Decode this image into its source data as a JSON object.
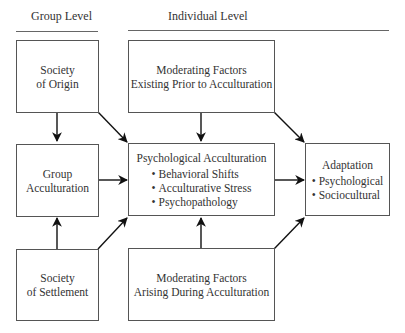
{
  "headers": {
    "group_level": "Group Level",
    "individual_level": "Individual Level"
  },
  "boxes": {
    "society_origin": {
      "line1": "Society",
      "line2": "of Origin"
    },
    "group_acculturation": {
      "line1": "Group",
      "line2": "Acculturation"
    },
    "society_settlement": {
      "line1": "Society",
      "line2": "of Settlement"
    },
    "moderating_prior": {
      "line1": "Moderating Factors",
      "line2": "Existing Prior to Acculturation"
    },
    "psychological_acculturation": {
      "title": "Psychological Acculturation",
      "items": [
        "Behavioral Shifts",
        "Acculturative Stress",
        "Psychopathology"
      ]
    },
    "moderating_during": {
      "line1": "Moderating Factors",
      "line2": "Arising During Acculturation"
    },
    "adaptation": {
      "title": "Adaptation",
      "items": [
        "Psychological",
        "Sociocultural"
      ]
    }
  },
  "edges": [
    {
      "from": "Society of Origin",
      "to": "Group Acculturation"
    },
    {
      "from": "Society of Settlement",
      "to": "Group Acculturation"
    },
    {
      "from": "Society of Origin",
      "to": "Psychological Acculturation"
    },
    {
      "from": "Group Acculturation",
      "to": "Psychological Acculturation"
    },
    {
      "from": "Society of Settlement",
      "to": "Psychological Acculturation"
    },
    {
      "from": "Moderating Factors Existing Prior to Acculturation",
      "to": "Psychological Acculturation"
    },
    {
      "from": "Moderating Factors Arising During Acculturation",
      "to": "Psychological Acculturation"
    },
    {
      "from": "Moderating Factors Existing Prior to Acculturation",
      "to": "Adaptation"
    },
    {
      "from": "Psychological Acculturation",
      "to": "Adaptation"
    },
    {
      "from": "Moderating Factors Arising During Acculturation",
      "to": "Adaptation"
    }
  ]
}
